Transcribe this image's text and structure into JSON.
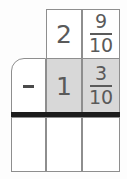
{
  "problem": {
    "type": "vertical-subtraction",
    "operator": "−",
    "operator_icon": "minus-icon",
    "minuend": {
      "whole": "2",
      "fraction_numerator": "9",
      "fraction_denominator": "10",
      "fraction_label": "9/10",
      "display": "2 9/10"
    },
    "subtrahend": {
      "whole": "1",
      "fraction_numerator": "3",
      "fraction_denominator": "10",
      "fraction_label": "3/10",
      "display": "1 3/10"
    },
    "answer": {
      "operator_cell": "",
      "whole": "",
      "fraction_numerator": "",
      "fraction_denominator": ""
    }
  },
  "colors": {
    "background": "#fdfdfd",
    "grid_line": "#8e8e8e",
    "shaded_cell": "#d8d8d8",
    "ink": "#5a5a5a",
    "answer_rule": "#1c1c1c"
  },
  "layout": {
    "rows": 3,
    "columns": 3,
    "shaded_cells": "row2-col2, row2-col3",
    "rule_position": "between row 2 and row 3"
  }
}
